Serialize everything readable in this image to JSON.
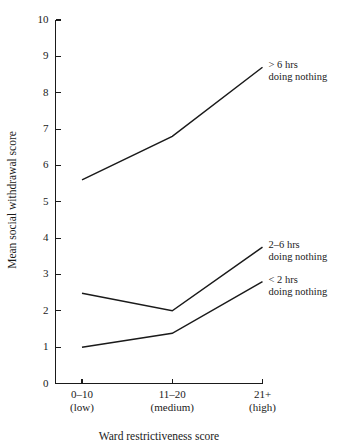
{
  "chart_data": {
    "type": "line",
    "title": "",
    "xlabel": "Ward restrictiveness score",
    "ylabel": "Mean social withdrawal score",
    "categories": [
      "0–10",
      "11–20",
      "21+"
    ],
    "category_sublabels": [
      "(low)",
      "(medium)",
      "(high)"
    ],
    "ylim": [
      0,
      10
    ],
    "yticks": [
      0,
      1,
      2,
      3,
      4,
      5,
      6,
      7,
      8,
      9,
      10
    ],
    "ytick_labels": [
      "0",
      "1",
      "2",
      "3",
      "4",
      "5",
      "6",
      "7",
      "8",
      "9",
      "10"
    ],
    "grid": false,
    "legend_position": "right-inline-annotations",
    "line_color": "#1a1a1a",
    "background_color": "#ffffff",
    "series": [
      {
        "name": "> 6 hrs doing nothing",
        "label_line1": "> 6 hrs",
        "label_line2": "doing nothing",
        "values": [
          5.6,
          6.8,
          8.7
        ]
      },
      {
        "name": "2–6 hrs doing nothing",
        "label_line1": "2–6 hrs",
        "label_line2": "doing nothing",
        "values": [
          2.48,
          2.0,
          3.75
        ]
      },
      {
        "name": "< 2 hrs doing nothing",
        "label_line1": "< 2 hrs",
        "label_line2": "doing nothing",
        "values": [
          1.0,
          1.38,
          2.8
        ]
      }
    ]
  }
}
